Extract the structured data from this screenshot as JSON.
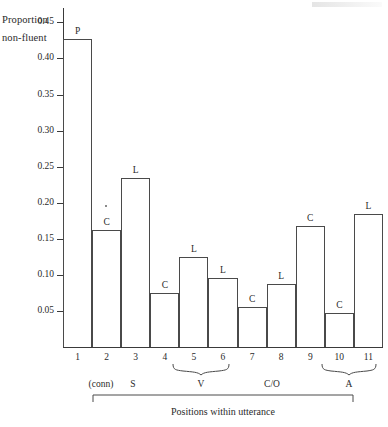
{
  "chart_data": {
    "type": "bar",
    "title": "",
    "ylabel": "Proportion non-fluent",
    "ylabel_lines": [
      "Proportion",
      "non-fluent"
    ],
    "xlabel": "Positions within utterance",
    "categories": [
      "1",
      "2",
      "3",
      "4",
      "5",
      "6",
      "7",
      "8",
      "9",
      "10",
      "11"
    ],
    "values": [
      0.427,
      0.162,
      0.235,
      0.075,
      0.125,
      0.095,
      0.055,
      0.088,
      0.168,
      0.047,
      0.185
    ],
    "bar_labels": [
      "P",
      "C",
      "L",
      "C",
      "L",
      "L",
      "C",
      "L",
      "C",
      "C",
      "L"
    ],
    "ylim": [
      0,
      0.47
    ],
    "ytick_values": [
      0.05,
      0.1,
      0.15,
      0.2,
      0.25,
      0.3,
      0.35,
      0.4,
      0.45
    ],
    "ytick_labels": [
      "0.05",
      "0.10",
      "0.15",
      "0.20",
      "0.25",
      "0.30",
      "0.35",
      "0.40",
      "0.45"
    ],
    "grid": false,
    "legend": "none",
    "annotations": [
      {
        "text": "(conn)",
        "at_position": 2,
        "kind": "group-label"
      },
      {
        "text": "S",
        "at_position": 3,
        "kind": "group-label"
      },
      {
        "text": "V",
        "spans": [
          5,
          6
        ],
        "kind": "brace-label"
      },
      {
        "text": "C/O",
        "spans": [
          8,
          9
        ],
        "kind": "group-label"
      },
      {
        "text": "A",
        "spans": [
          10,
          11
        ],
        "kind": "brace-label"
      }
    ],
    "axis_bracket": {
      "label": "Positions within utterance",
      "spans": [
        2,
        11
      ]
    }
  },
  "ylabel": {
    "line1": "Proportion",
    "line2": "non-fluent"
  },
  "xcaption": "Positions within utterance",
  "groups": {
    "conn": "(conn)",
    "s": "S",
    "v": "V",
    "co": "C/O",
    "a": "A"
  },
  "ticks": {
    "t045": "0.45",
    "t040": "0.40",
    "t035": "0.35",
    "t030": "0.30",
    "t025": "0.25",
    "t020": "0.20",
    "t015": "0.15",
    "t010": "0.10",
    "t005": "0.05"
  }
}
